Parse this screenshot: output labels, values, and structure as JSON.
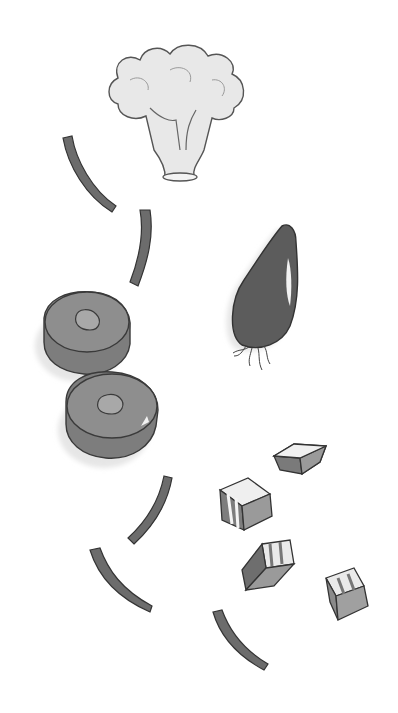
{
  "illustration": {
    "style": "grayscale watercolor",
    "colors": {
      "background": "#ffffff",
      "outline": "#3a3a3a",
      "dark_fill": "#5a5a5a",
      "mid_fill": "#8a8a8a",
      "light_fill": "#c8c8c8",
      "shadow": "#e4e4e4"
    },
    "items": [
      {
        "name": "broccoli-floret"
      },
      {
        "name": "onion"
      },
      {
        "name": "vegetable-slice-top"
      },
      {
        "name": "vegetable-slice-bottom"
      },
      {
        "name": "curved-strips"
      },
      {
        "name": "cubes"
      }
    ]
  }
}
